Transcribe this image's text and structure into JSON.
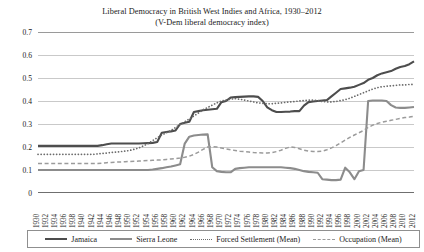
{
  "chart_data": {
    "type": "line",
    "title": "Liberal Democracy in British West Indies and Africa, 1930–2012",
    "subtitle": "(V-Dem liberal democracy index)",
    "xlabel": "",
    "ylabel": "",
    "ylim": [
      0,
      0.7
    ],
    "ytick_labels": [
      "0",
      "0.1",
      "0.2",
      "0.3",
      "0.4",
      "0.5",
      "0.6",
      "0.7"
    ],
    "ytick_values": [
      0,
      0.1,
      0.2,
      0.3,
      0.4,
      0.5,
      0.6,
      0.7
    ],
    "grid": true,
    "legend_position": "bottom",
    "xlim": [
      1930,
      2012
    ],
    "x": [
      1930,
      1931,
      1932,
      1933,
      1934,
      1935,
      1936,
      1937,
      1938,
      1939,
      1940,
      1941,
      1942,
      1943,
      1944,
      1945,
      1946,
      1947,
      1948,
      1949,
      1950,
      1951,
      1952,
      1953,
      1954,
      1955,
      1956,
      1957,
      1958,
      1959,
      1960,
      1961,
      1962,
      1963,
      1964,
      1965,
      1966,
      1967,
      1968,
      1969,
      1970,
      1971,
      1972,
      1973,
      1974,
      1975,
      1976,
      1977,
      1978,
      1979,
      1980,
      1981,
      1982,
      1983,
      1984,
      1985,
      1986,
      1987,
      1988,
      1989,
      1990,
      1991,
      1992,
      1993,
      1994,
      1995,
      1996,
      1997,
      1998,
      1999,
      2000,
      2001,
      2002,
      2003,
      2004,
      2005,
      2006,
      2007,
      2008,
      2009,
      2010,
      2011,
      2012
    ],
    "xtick_labels": [
      "1930",
      "1932",
      "1934",
      "1936",
      "1938",
      "1940",
      "1942",
      "1944",
      "1946",
      "1948",
      "1950",
      "1952",
      "1954",
      "1956",
      "1958",
      "1960",
      "1962",
      "1964",
      "1966",
      "1968",
      "1970",
      "1972",
      "1974",
      "1976",
      "1978",
      "1980",
      "1982",
      "1984",
      "1986",
      "1988",
      "1990",
      "1992",
      "1994",
      "1996",
      "1998",
      "2000",
      "2002",
      "2004",
      "2006",
      "2008",
      "2010",
      "2012"
    ],
    "series": [
      {
        "name": "Jamaica",
        "style": "solid",
        "color": "#4d4d4d",
        "width": 2.1,
        "values": [
          0.205,
          0.205,
          0.205,
          0.205,
          0.205,
          0.205,
          0.205,
          0.205,
          0.205,
          0.205,
          0.205,
          0.205,
          0.205,
          0.205,
          0.208,
          0.212,
          0.215,
          0.215,
          0.215,
          0.215,
          0.215,
          0.215,
          0.215,
          0.216,
          0.217,
          0.218,
          0.222,
          0.262,
          0.265,
          0.268,
          0.272,
          0.3,
          0.305,
          0.31,
          0.352,
          0.356,
          0.36,
          0.362,
          0.364,
          0.366,
          0.395,
          0.4,
          0.415,
          0.417,
          0.418,
          0.419,
          0.42,
          0.42,
          0.418,
          0.4,
          0.372,
          0.36,
          0.352,
          0.352,
          0.353,
          0.354,
          0.356,
          0.356,
          0.38,
          0.395,
          0.398,
          0.4,
          0.402,
          0.404,
          0.42,
          0.436,
          0.452,
          0.455,
          0.458,
          0.462,
          0.47,
          0.478,
          0.492,
          0.5,
          0.512,
          0.52,
          0.525,
          0.53,
          0.54,
          0.548,
          0.552,
          0.56,
          0.572
        ]
      },
      {
        "name": "Sierra Leone",
        "style": "solid",
        "color": "#8c8c8c",
        "width": 2.1,
        "values": [
          0.1,
          0.1,
          0.1,
          0.1,
          0.1,
          0.1,
          0.1,
          0.1,
          0.1,
          0.1,
          0.1,
          0.1,
          0.1,
          0.1,
          0.1,
          0.1,
          0.1,
          0.1,
          0.1,
          0.1,
          0.1,
          0.1,
          0.1,
          0.1,
          0.1,
          0.102,
          0.105,
          0.108,
          0.112,
          0.115,
          0.12,
          0.125,
          0.215,
          0.245,
          0.25,
          0.252,
          0.254,
          0.255,
          0.112,
          0.095,
          0.092,
          0.09,
          0.09,
          0.105,
          0.108,
          0.11,
          0.112,
          0.112,
          0.112,
          0.112,
          0.112,
          0.112,
          0.112,
          0.112,
          0.11,
          0.108,
          0.105,
          0.1,
          0.095,
          0.092,
          0.09,
          0.088,
          0.06,
          0.058,
          0.056,
          0.056,
          0.058,
          0.11,
          0.09,
          0.06,
          0.095,
          0.1,
          0.4,
          0.402,
          0.402,
          0.402,
          0.4,
          0.382,
          0.372,
          0.37,
          0.37,
          0.372,
          0.374
        ]
      },
      {
        "name": "Forced Settlement (Mean)",
        "style": "dotted",
        "color": "#6b6b6b",
        "width": 1.7,
        "values": [
          0.168,
          0.168,
          0.168,
          0.168,
          0.168,
          0.168,
          0.168,
          0.168,
          0.168,
          0.168,
          0.168,
          0.168,
          0.168,
          0.17,
          0.172,
          0.174,
          0.176,
          0.178,
          0.18,
          0.182,
          0.185,
          0.19,
          0.196,
          0.205,
          0.215,
          0.228,
          0.24,
          0.252,
          0.262,
          0.272,
          0.285,
          0.298,
          0.31,
          0.322,
          0.335,
          0.348,
          0.362,
          0.372,
          0.382,
          0.392,
          0.4,
          0.405,
          0.408,
          0.41,
          0.408,
          0.404,
          0.4,
          0.396,
          0.392,
          0.39,
          0.388,
          0.388,
          0.39,
          0.392,
          0.394,
          0.396,
          0.398,
          0.4,
          0.402,
          0.404,
          0.404,
          0.402,
          0.398,
          0.396,
          0.396,
          0.398,
          0.402,
          0.406,
          0.412,
          0.42,
          0.428,
          0.436,
          0.444,
          0.452,
          0.458,
          0.462,
          0.464,
          0.466,
          0.468,
          0.47,
          0.47,
          0.472,
          0.472
        ]
      },
      {
        "name": "Occupation (Mean)",
        "style": "dashed",
        "color": "#9b9b9b",
        "width": 1.5,
        "values": [
          0.128,
          0.128,
          0.128,
          0.128,
          0.128,
          0.128,
          0.128,
          0.128,
          0.128,
          0.128,
          0.128,
          0.128,
          0.128,
          0.128,
          0.13,
          0.132,
          0.133,
          0.134,
          0.135,
          0.136,
          0.137,
          0.138,
          0.139,
          0.14,
          0.141,
          0.142,
          0.143,
          0.144,
          0.146,
          0.148,
          0.15,
          0.152,
          0.155,
          0.16,
          0.168,
          0.178,
          0.19,
          0.2,
          0.202,
          0.2,
          0.196,
          0.192,
          0.188,
          0.185,
          0.182,
          0.18,
          0.178,
          0.176,
          0.175,
          0.174,
          0.174,
          0.176,
          0.18,
          0.186,
          0.194,
          0.2,
          0.198,
          0.192,
          0.186,
          0.182,
          0.18,
          0.18,
          0.182,
          0.188,
          0.196,
          0.206,
          0.218,
          0.23,
          0.242,
          0.252,
          0.262,
          0.272,
          0.285,
          0.295,
          0.302,
          0.308,
          0.312,
          0.316,
          0.32,
          0.324,
          0.328,
          0.33,
          0.334
        ]
      }
    ]
  }
}
